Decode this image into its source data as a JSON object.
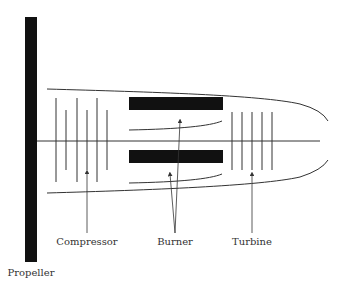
{
  "diagram": {
    "colors": {
      "stroke": "#333333",
      "solid": "#111111",
      "background": "#ffffff"
    },
    "labels": {
      "propeller": "Propeller",
      "compressor": "Compressor",
      "burner": "Burner",
      "turbine": "Turbine"
    },
    "components": [
      {
        "id": "propeller",
        "shape": "vertical-bar"
      },
      {
        "id": "compressor",
        "shape": "blade-stages",
        "count": 6
      },
      {
        "id": "burner",
        "shape": "two-bars-with-liners"
      },
      {
        "id": "turbine",
        "shape": "blade-stages",
        "count": 5
      },
      {
        "id": "casing",
        "shape": "elongated-nacelle"
      },
      {
        "id": "shaft",
        "shape": "horizontal-line"
      }
    ]
  }
}
